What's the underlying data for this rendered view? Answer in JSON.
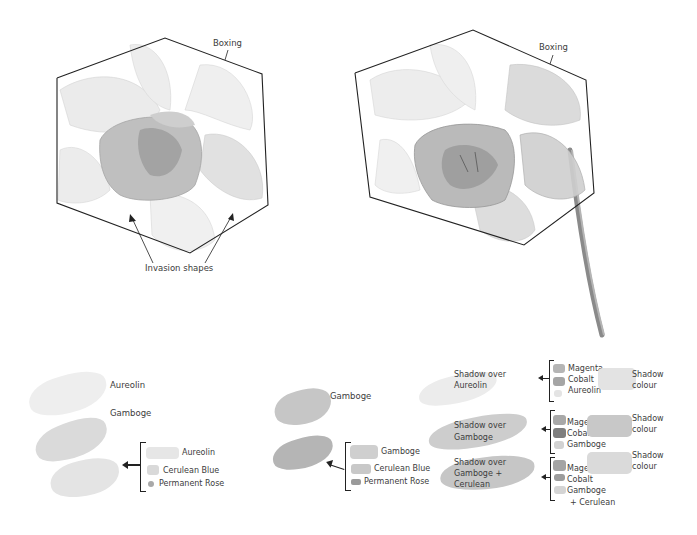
{
  "figures": {
    "left": {
      "boxing_label": "Boxing",
      "invasion_label": "Invasion shapes"
    },
    "right": {
      "boxing_label": "Boxing"
    }
  },
  "swatches_left": {
    "rows": [
      {
        "label": "Aureolin",
        "color": "#ececec"
      },
      {
        "label": "Gamboge",
        "color": "#d7d7d7"
      }
    ],
    "mix_result_color": "#e3e3e3",
    "mix": [
      {
        "label": "Aureolin",
        "color": "#e6e6e6"
      },
      {
        "label": "Cerulean Blue",
        "color": "#d9d9d9"
      },
      {
        "label": "Permanent Rose",
        "color": "#a9a9a9"
      }
    ]
  },
  "swatches_middle": {
    "rows": [
      {
        "label": "Gamboge",
        "color": "#c4c4c4"
      }
    ],
    "mix_result_color": "#b8b8b8",
    "mix": [
      {
        "label": "Gamboge",
        "color": "#cfcfcf"
      },
      {
        "label": "Cerulean Blue",
        "color": "#c8c8c8"
      },
      {
        "label": "Permanent Rose",
        "color": "#9a9a9a"
      }
    ]
  },
  "swatches_right": {
    "groups": [
      {
        "title_line1": "Shadow over",
        "title_line2": "Aureolin",
        "title_line3": "",
        "base_color": "#ececec",
        "components": [
          {
            "label": "Magenta",
            "color": "#b5b5b5"
          },
          {
            "label": "Cobalt",
            "color": "#a5a5a5"
          },
          {
            "label": "Aureolin",
            "color": "#e4e4e4"
          }
        ],
        "extra": "",
        "result_label_line1": "Shadow",
        "result_label_line2": "colour",
        "result_color": "#e3e3e3"
      },
      {
        "title_line1": "Shadow over",
        "title_line2": "Gamboge",
        "title_line3": "",
        "base_color": "#cdcdcd",
        "components": [
          {
            "label": "Magenta",
            "color": "#a8a8a8"
          },
          {
            "label": "Cobalt",
            "color": "#7e7e7e"
          },
          {
            "label": "Gamboge",
            "color": "#d2d2d2"
          }
        ],
        "extra": "",
        "result_label_line1": "Shadow",
        "result_label_line2": "colour",
        "result_color": "#c8c8c8"
      },
      {
        "title_line1": "Shadow over",
        "title_line2": "Gamboge +",
        "title_line3": "Cerulean",
        "base_color": "#c6c6c6",
        "components": [
          {
            "label": "Magenta",
            "color": "#a4a4a4"
          },
          {
            "label": "Cobalt",
            "color": "#9c9c9c"
          },
          {
            "label": "Gamboge",
            "color": "#d4d4d4"
          }
        ],
        "extra": "+  Cerulean",
        "result_label_line1": "Shadow",
        "result_label_line2": "colour",
        "result_color": "#dadada"
      }
    ]
  }
}
